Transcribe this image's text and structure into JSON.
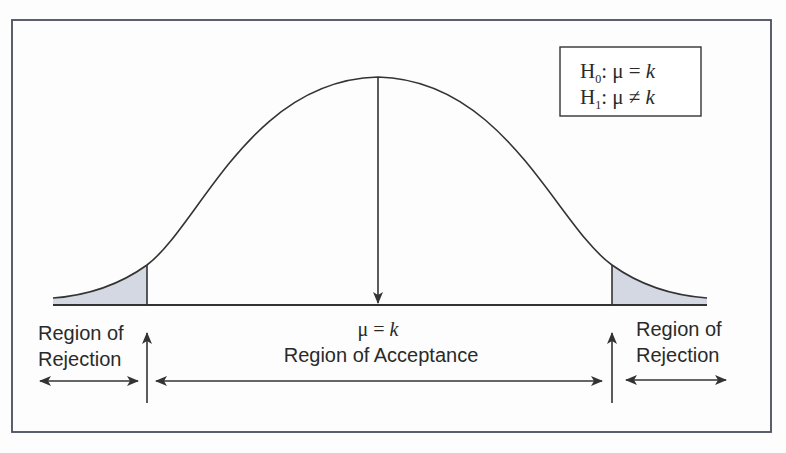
{
  "hypotheses": {
    "h0_symbol": "H",
    "h0_sub": "0",
    "h0_rel": ": μ = ",
    "h0_var": "k",
    "h1_symbol": "H",
    "h1_sub": "1",
    "h1_rel": ": μ ≠ ",
    "h1_var": "k"
  },
  "center_label": {
    "mu": "μ = ",
    "var": "k",
    "region": "Region of Acceptance"
  },
  "left_region": {
    "line1": "Region of",
    "line2": "Rejection"
  },
  "right_region": {
    "line1": "Region of",
    "line2": "Rejection"
  },
  "colors": {
    "line": "#333333",
    "shade": "#d3d8e3",
    "frame": "#4a4e5e"
  }
}
